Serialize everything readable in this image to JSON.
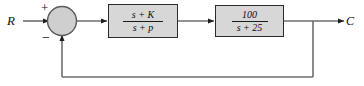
{
  "diagram": {
    "kind": "control-system-block-diagram",
    "title": "",
    "colors": {
      "line": "#6e6e6e",
      "block_fill": "#d7d7d7",
      "block_border": "#2b2b2b",
      "text": "#111111",
      "background": "#ffffff",
      "junction_fill": "#cfcfcf"
    },
    "input": {
      "label": "R"
    },
    "output": {
      "label": "C"
    },
    "summing_junction": {
      "name": "summing-junction",
      "positive_sign": "+",
      "negative_sign": "−"
    },
    "blocks": [
      {
        "name": "compensator",
        "numerator": "s + K",
        "denominator": "s + p"
      },
      {
        "name": "plant",
        "numerator": "100",
        "denominator": "s + 25"
      }
    ],
    "feedback": {
      "type": "unity",
      "label": ""
    }
  }
}
